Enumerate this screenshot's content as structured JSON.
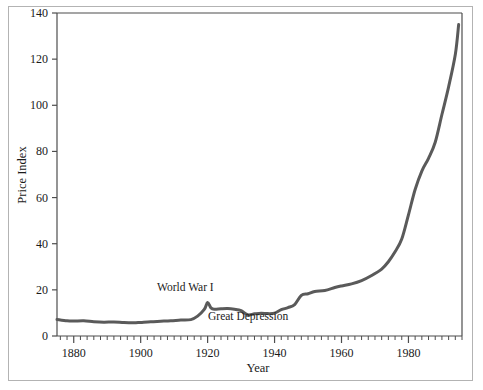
{
  "figure": {
    "background_color": "#ffffff",
    "frame_color": "#b3b3b3"
  },
  "chart_data": {
    "type": "line",
    "title": "",
    "xlabel": "Year",
    "ylabel": "Price Index",
    "xlim": [
      1875,
      1996
    ],
    "ylim": [
      0,
      140
    ],
    "grid": false,
    "legend": null,
    "line_color": "#5a5a5a",
    "line_width": 3,
    "x_ticks_major": [
      1880,
      1900,
      1920,
      1940,
      1960,
      1980
    ],
    "x_tick_labels": [
      "1880",
      "1900",
      "1920",
      "1940",
      "1960",
      "1980"
    ],
    "x_minor_tick_step": 2,
    "y_ticks_major": [
      0,
      20,
      40,
      60,
      80,
      100,
      120,
      140
    ],
    "y_tick_labels": [
      "0",
      "20",
      "40",
      "60",
      "80",
      "100",
      "120",
      "140"
    ],
    "series": [
      {
        "name": "Price Index",
        "x": [
          1875,
          1878,
          1880,
          1883,
          1886,
          1889,
          1892,
          1895,
          1898,
          1900,
          1903,
          1906,
          1909,
          1912,
          1915,
          1917,
          1919,
          1920,
          1921,
          1922,
          1924,
          1926,
          1928,
          1930,
          1932,
          1934,
          1936,
          1938,
          1940,
          1942,
          1944,
          1946,
          1948,
          1950,
          1952,
          1955,
          1958,
          1960,
          1963,
          1966,
          1969,
          1972,
          1974,
          1976,
          1978,
          1980,
          1982,
          1984,
          1986,
          1988,
          1990,
          1992,
          1994,
          1995
        ],
        "y": [
          7.2,
          6.6,
          6.5,
          6.6,
          6.2,
          6.0,
          6.1,
          5.8,
          5.7,
          5.9,
          6.2,
          6.4,
          6.6,
          6.9,
          7.1,
          8.6,
          11.5,
          14.5,
          12.2,
          11.6,
          11.8,
          11.9,
          11.6,
          11.0,
          9.2,
          9.6,
          9.9,
          9.7,
          9.9,
          11.4,
          12.3,
          13.6,
          17.6,
          18.3,
          19.3,
          19.7,
          21.0,
          21.7,
          22.6,
          24.0,
          26.2,
          29.0,
          32.2,
          36.5,
          42.0,
          52.5,
          63.5,
          71.5,
          77.0,
          84.0,
          96.0,
          108.0,
          122.0,
          135.0
        ]
      }
    ],
    "annotations": [
      {
        "text": "World War I",
        "x_px": 157,
        "y_px": 291
      },
      {
        "text": "Great Depression",
        "x_px": 208,
        "y_px": 320
      }
    ]
  }
}
